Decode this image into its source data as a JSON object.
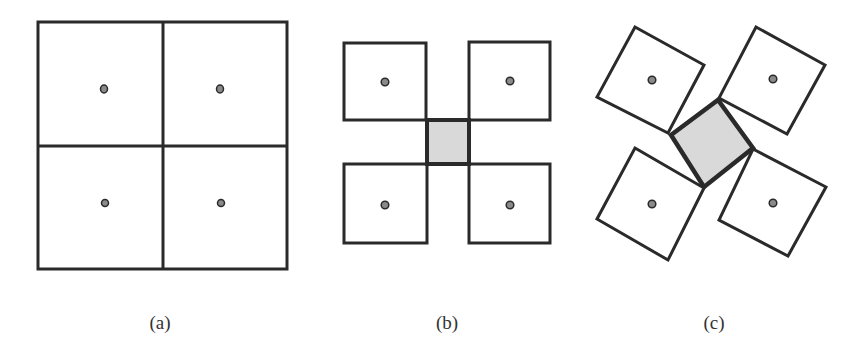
{
  "figure": {
    "colors": {
      "stroke": "#2a2a2a",
      "dot_fill": "#8a8a8a",
      "center_fill": "#d9d9d9",
      "background": "#ffffff"
    },
    "panels": [
      {
        "id": "a",
        "caption": "(a)",
        "description": "2x2 grid of adjacent squares, each with a center dot"
      },
      {
        "id": "b",
        "caption": "(b)",
        "description": "four separated squares with a shaded square between them"
      },
      {
        "id": "c",
        "caption": "(c)",
        "description": "four rotated squares around a rotated shaded square"
      }
    ]
  }
}
